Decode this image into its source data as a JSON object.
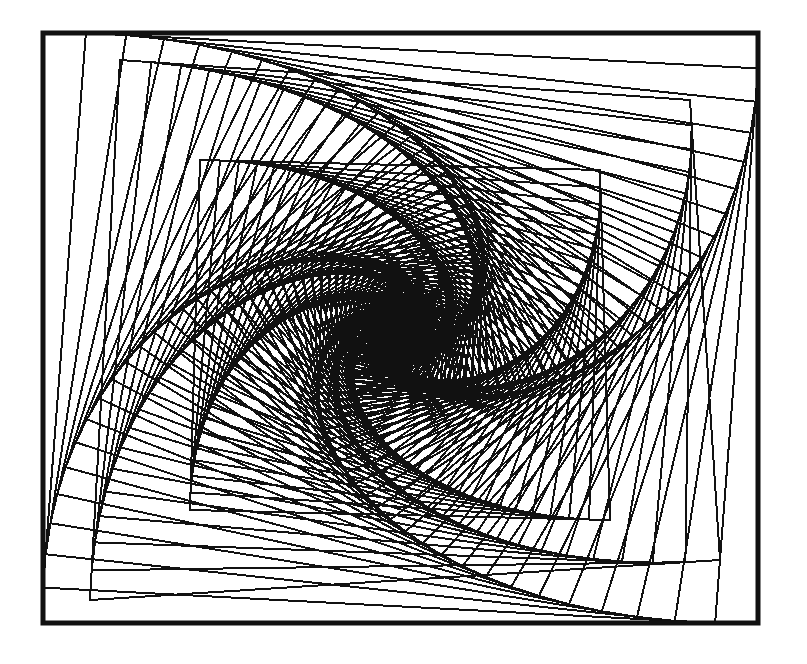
{
  "artwork": {
    "type": "nested-rotating-squares-whirl",
    "background": "#ffffff",
    "ink": "#111111",
    "frame": {
      "x0": 43,
      "y0": 33,
      "x1": 758,
      "y1": 623,
      "stroke_width": 5
    },
    "center": {
      "x": 405,
      "y": 325
    },
    "line_width": 2,
    "whirls": [
      {
        "name": "outer-whirl",
        "corners": [
          [
            43,
            33
          ],
          [
            758,
            33
          ],
          [
            758,
            623
          ],
          [
            43,
            623
          ]
        ],
        "fraction": 0.06,
        "steps": 70
      },
      {
        "name": "ring-whirl",
        "corners": [
          [
            120,
            60
          ],
          [
            690,
            100
          ],
          [
            720,
            560
          ],
          [
            90,
            600
          ]
        ],
        "fraction": 0.055,
        "steps": 60
      },
      {
        "name": "inner-whirl",
        "corners": [
          [
            200,
            160
          ],
          [
            600,
            170
          ],
          [
            610,
            520
          ],
          [
            190,
            510
          ]
        ],
        "fraction": 0.05,
        "steps": 80
      }
    ]
  }
}
